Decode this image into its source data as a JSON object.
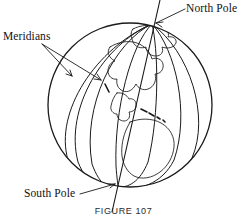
{
  "figure": {
    "caption": "FIGURE 107",
    "background_color": "#ffffff",
    "ink_color": "#1a1a1a",
    "labels": {
      "meridians": "Meridians",
      "north_pole": "North Pole",
      "south_pole": "South Pole"
    },
    "annotations": [
      {
        "name": "meridians",
        "text": "Meridians",
        "position": "upper-left",
        "leader_count": 2,
        "points_to": "meridian-lines"
      },
      {
        "name": "north-pole",
        "text": "North Pole",
        "position": "upper-right",
        "leader_count": 1,
        "points_to": "north-pole-point"
      },
      {
        "name": "south-pole",
        "text": "South Pole",
        "position": "lower-left",
        "leader_count": 1,
        "points_to": "south-pole-point"
      }
    ],
    "diagram": {
      "subject": "earth-globe",
      "sphere_center_x": 130,
      "sphere_center_y": 105,
      "sphere_radius": 82,
      "meridian_count": 7,
      "axis_tilt_degrees": 12,
      "landmass": "The Americas",
      "features": [
        "sphere-outline",
        "meridian-lines",
        "rotation-axis",
        "north-pole-point",
        "south-pole-point",
        "continent-outline-north-america",
        "continent-outline-south-america",
        "caribbean-islands"
      ]
    }
  }
}
